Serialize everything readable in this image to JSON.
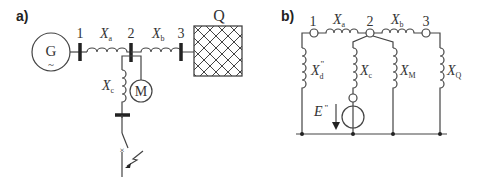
{
  "diagram_a": {
    "panel_label": "a)",
    "generator": {
      "label": "G",
      "symbol": "~"
    },
    "buses": [
      "1",
      "2",
      "3"
    ],
    "reactances": {
      "a": "X",
      "a_sub": "a",
      "b": "X",
      "b_sub": "b",
      "c": "X",
      "c_sub": "c"
    },
    "motor": {
      "label": "M"
    },
    "grid": {
      "label": "Q"
    },
    "fault_marker": "×"
  },
  "diagram_b": {
    "panel_label": "b)",
    "nodes": [
      "1",
      "2",
      "3"
    ],
    "reactances": {
      "a": "X",
      "a_sub": "a",
      "b": "X",
      "b_sub": "b",
      "d": "X",
      "d_sub": "d",
      "d_sup": "\"",
      "c": "X",
      "c_sub": "c",
      "M": "X",
      "M_sub": "M",
      "Q": "X",
      "Q_sub": "Q"
    },
    "source": {
      "label": "E",
      "sup": "\""
    }
  },
  "colors": {
    "line": "#444444",
    "text": "#333333",
    "background": "#ffffff"
  }
}
